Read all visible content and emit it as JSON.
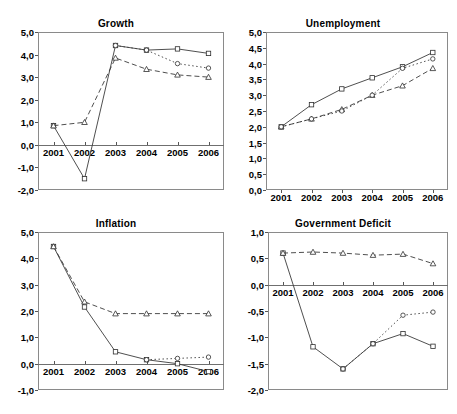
{
  "figure": {
    "decimal_separator": ",",
    "series_names": [
      "series-1-square-solid",
      "series-2-triangle-dashed",
      "series-3-circle-dotted"
    ],
    "caption": ""
  },
  "chart_data": [
    {
      "id": "growth",
      "type": "line",
      "title": "Growth",
      "xlabel": "",
      "ylabel": "",
      "x": [
        "2001",
        "2002",
        "2003",
        "2004",
        "2005",
        "2006"
      ],
      "xticklabels": [
        "2001",
        "2002",
        "2003",
        "2004",
        "2005",
        "2006"
      ],
      "ylim": [
        -2.0,
        5.0
      ],
      "yticks": [
        -2.0,
        -1.0,
        0.0,
        1.0,
        2.0,
        3.0,
        4.0,
        5.0
      ],
      "yticklabels": [
        "-2,0",
        "-1,0",
        "0,0",
        "1,0",
        "2,0",
        "3,0",
        "4,0",
        "5,0"
      ],
      "grid": false,
      "legend": "none",
      "series": [
        {
          "name": "series-1-square-solid",
          "marker": "square",
          "line": "solid",
          "values": [
            0.85,
            -1.5,
            4.4,
            4.2,
            4.25,
            4.05
          ]
        },
        {
          "name": "series-2-triangle-dashed",
          "marker": "triangle",
          "line": "dashed",
          "values": [
            0.85,
            1.0,
            3.85,
            3.35,
            3.1,
            3.0
          ]
        },
        {
          "name": "series-3-circle-dotted",
          "marker": "circle",
          "line": "dotted",
          "values": [
            null,
            null,
            4.4,
            4.2,
            3.6,
            3.4
          ]
        }
      ]
    },
    {
      "id": "unemployment",
      "type": "line",
      "title": "Unemployment",
      "xlabel": "",
      "ylabel": "",
      "x": [
        "2001",
        "2002",
        "2003",
        "2004",
        "2005",
        "2006"
      ],
      "xticklabels": [
        "2001",
        "2002",
        "2003",
        "2004",
        "2005",
        "2006"
      ],
      "ylim": [
        0.0,
        5.0
      ],
      "yticks": [
        0.0,
        0.5,
        1.0,
        1.5,
        2.0,
        2.5,
        3.0,
        3.5,
        4.0,
        4.5,
        5.0
      ],
      "yticklabels": [
        "0,0",
        "0,5",
        "1,0",
        "1,5",
        "2,0",
        "2,5",
        "3,0",
        "3,5",
        "4,0",
        "4,5",
        "5,0"
      ],
      "grid": false,
      "legend": "none",
      "series": [
        {
          "name": "series-1-square-solid",
          "marker": "square",
          "line": "solid",
          "values": [
            2.0,
            2.7,
            3.2,
            3.55,
            3.9,
            4.35
          ]
        },
        {
          "name": "series-2-triangle-dashed",
          "marker": "triangle",
          "line": "dashed",
          "values": [
            2.0,
            2.25,
            2.55,
            3.0,
            3.3,
            3.85
          ]
        },
        {
          "name": "series-3-circle-dotted",
          "marker": "circle",
          "line": "dotted",
          "values": [
            2.0,
            2.25,
            2.5,
            3.0,
            3.85,
            4.15
          ]
        }
      ]
    },
    {
      "id": "inflation",
      "type": "line",
      "title": "Inflation",
      "xlabel": "",
      "ylabel": "",
      "x": [
        "2001",
        "2002",
        "2003",
        "2004",
        "2005",
        "2006"
      ],
      "xticklabels": [
        "2001",
        "2002",
        "2003",
        "2004",
        "2005",
        "2006"
      ],
      "ylim": [
        -1.0,
        5.0
      ],
      "yticks": [
        -1.0,
        0.0,
        1.0,
        2.0,
        3.0,
        4.0,
        5.0
      ],
      "yticklabels": [
        "-1,0",
        "0,0",
        "1,0",
        "2,0",
        "3,0",
        "4,0",
        "5,0"
      ],
      "grid": false,
      "legend": "none",
      "series": [
        {
          "name": "series-1-square-solid",
          "marker": "square",
          "line": "solid",
          "values": [
            4.45,
            2.15,
            0.45,
            0.15,
            0.0,
            -0.3
          ]
        },
        {
          "name": "series-2-triangle-dashed",
          "marker": "triangle",
          "line": "dashed",
          "values": [
            4.45,
            2.35,
            1.9,
            1.9,
            1.9,
            1.9
          ]
        },
        {
          "name": "series-3-circle-dotted",
          "marker": "circle",
          "line": "dotted",
          "values": [
            null,
            null,
            null,
            0.15,
            0.2,
            0.25
          ]
        }
      ]
    },
    {
      "id": "government-deficit",
      "type": "line",
      "title": "Government Deficit",
      "xlabel": "",
      "ylabel": "",
      "x": [
        "2001",
        "2002",
        "2003",
        "2004",
        "2005",
        "2006"
      ],
      "xticklabels": [
        "2001",
        "2002",
        "2003",
        "2004",
        "2005",
        "2006"
      ],
      "ylim": [
        -2.0,
        1.0
      ],
      "yticks": [
        -2.0,
        -1.5,
        -1.0,
        -0.5,
        0.0,
        0.5,
        1.0
      ],
      "yticklabels": [
        "-2,0",
        "-1,5",
        "-1,0",
        "-0,5",
        "0,0",
        "0,5",
        "1,0"
      ],
      "grid": false,
      "legend": "none",
      "series": [
        {
          "name": "series-1-square-solid",
          "marker": "square",
          "line": "solid",
          "values": [
            0.6,
            -1.18,
            -1.6,
            -1.12,
            -0.93,
            -1.17
          ]
        },
        {
          "name": "series-2-triangle-dashed",
          "marker": "triangle",
          "line": "dashed",
          "values": [
            0.6,
            0.62,
            0.6,
            0.56,
            0.58,
            0.4
          ]
        },
        {
          "name": "series-3-circle-dotted",
          "marker": "circle",
          "line": "dotted",
          "values": [
            null,
            null,
            -1.6,
            -1.12,
            -0.58,
            -0.52
          ]
        }
      ]
    }
  ]
}
